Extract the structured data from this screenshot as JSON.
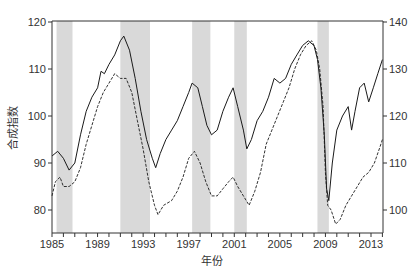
{
  "chart_data": {
    "type": "line",
    "title": "",
    "xlabel": "年份",
    "ylabel": "合成指数",
    "x_range": [
      1985,
      2014
    ],
    "x_ticks": [
      1985,
      1989,
      1993,
      1997,
      2001,
      2005,
      2009,
      2013
    ],
    "x_minor_ticks_every": 1,
    "left_axis": {
      "range": [
        75,
        120
      ],
      "ticks": [
        80,
        90,
        100,
        110,
        120
      ]
    },
    "right_axis": {
      "range": [
        95,
        140
      ],
      "ticks": [
        100,
        110,
        120,
        130,
        140
      ]
    },
    "grid": false,
    "legend": null,
    "shaded_regions": [
      {
        "start": 1985.4,
        "end": 1986.8
      },
      {
        "start": 1991.0,
        "end": 1993.6
      },
      {
        "start": 1997.3,
        "end": 1998.9
      },
      {
        "start": 2001.0,
        "end": 2002.1
      },
      {
        "start": 2008.3,
        "end": 2009.3
      }
    ],
    "series": [
      {
        "name": "solid (left axis)",
        "axis": "left",
        "style": "solid",
        "x": [
          1985.0,
          1985.5,
          1986.0,
          1986.5,
          1987.0,
          1987.5,
          1988.0,
          1988.5,
          1989.0,
          1989.3,
          1989.6,
          1990.0,
          1990.5,
          1991.0,
          1991.3,
          1991.8,
          1992.3,
          1992.8,
          1993.3,
          1993.8,
          1994.1,
          1994.5,
          1995.0,
          1995.5,
          1996.0,
          1996.5,
          1997.0,
          1997.3,
          1997.8,
          1998.2,
          1998.6,
          1999.0,
          1999.5,
          2000.0,
          2000.5,
          2000.9,
          2001.3,
          2001.8,
          2002.1,
          2002.5,
          2003.0,
          2003.5,
          2004.0,
          2004.5,
          2005.0,
          2005.5,
          2006.0,
          2006.5,
          2007.0,
          2007.5,
          2008.0,
          2008.3,
          2008.6,
          2008.9,
          2009.1,
          2009.3,
          2009.6,
          2010.0,
          2010.5,
          2011.0,
          2011.3,
          2011.6,
          2012.0,
          2012.4,
          2012.8,
          2013.2,
          2013.6,
          2014.0
        ],
        "values": [
          91.5,
          92.5,
          91,
          88.5,
          90,
          96,
          101,
          104,
          106,
          109.5,
          109,
          111,
          113,
          116,
          117,
          114,
          108,
          101,
          95,
          91,
          89,
          92,
          95,
          97,
          99,
          102,
          105,
          107,
          106,
          102,
          98,
          96,
          97,
          101,
          104,
          106,
          102,
          97,
          93,
          95,
          99,
          101,
          104,
          108,
          107,
          108,
          111,
          113,
          115,
          116,
          115,
          112,
          106,
          96,
          84.5,
          82,
          90,
          97,
          100,
          102,
          97,
          101,
          106,
          107,
          103,
          106,
          109,
          112
        ]
      },
      {
        "name": "dashed (right axis)",
        "axis": "right",
        "style": "dashed",
        "x": [
          1985.0,
          1985.3,
          1985.7,
          1986.0,
          1986.5,
          1987.0,
          1987.5,
          1988.0,
          1988.5,
          1989.0,
          1989.5,
          1990.0,
          1990.5,
          1991.0,
          1991.5,
          1992.0,
          1992.5,
          1993.0,
          1993.5,
          1994.0,
          1994.3,
          1994.8,
          1995.5,
          1996.0,
          1996.5,
          1997.0,
          1997.5,
          1998.0,
          1998.5,
          1999.0,
          1999.5,
          2000.0,
          2000.5,
          2000.9,
          2001.3,
          2001.8,
          2002.3,
          2002.8,
          2003.3,
          2003.8,
          2004.3,
          2004.8,
          2005.3,
          2005.8,
          2006.3,
          2006.8,
          2007.3,
          2007.8,
          2008.2,
          2008.5,
          2008.8,
          2009.0,
          2009.2,
          2009.5,
          2009.9,
          2010.3,
          2010.8,
          2011.3,
          2011.8,
          2012.3,
          2012.8,
          2013.3,
          2013.8,
          2014.0
        ],
        "values": [
          103,
          106,
          107,
          105,
          105,
          106,
          109,
          114,
          118,
          122,
          125,
          127,
          129,
          128,
          128,
          125,
          119,
          113,
          106,
          101,
          99,
          101,
          102,
          104,
          107,
          111,
          112.5,
          110,
          106,
          103,
          103,
          104.5,
          106,
          107,
          105,
          103,
          101,
          104,
          108,
          114,
          117,
          120,
          123,
          126,
          130,
          133,
          135,
          136,
          134,
          130,
          122,
          108,
          101,
          100,
          97,
          98,
          101,
          103,
          105,
          107,
          108,
          110,
          113.5,
          115
        ]
      }
    ]
  },
  "labels": {
    "xlabel": "年份",
    "ylabel": "合成指数"
  },
  "colors": {
    "line": "#1a1a1a",
    "band": "#d9d9d9",
    "axis": "#333333"
  }
}
